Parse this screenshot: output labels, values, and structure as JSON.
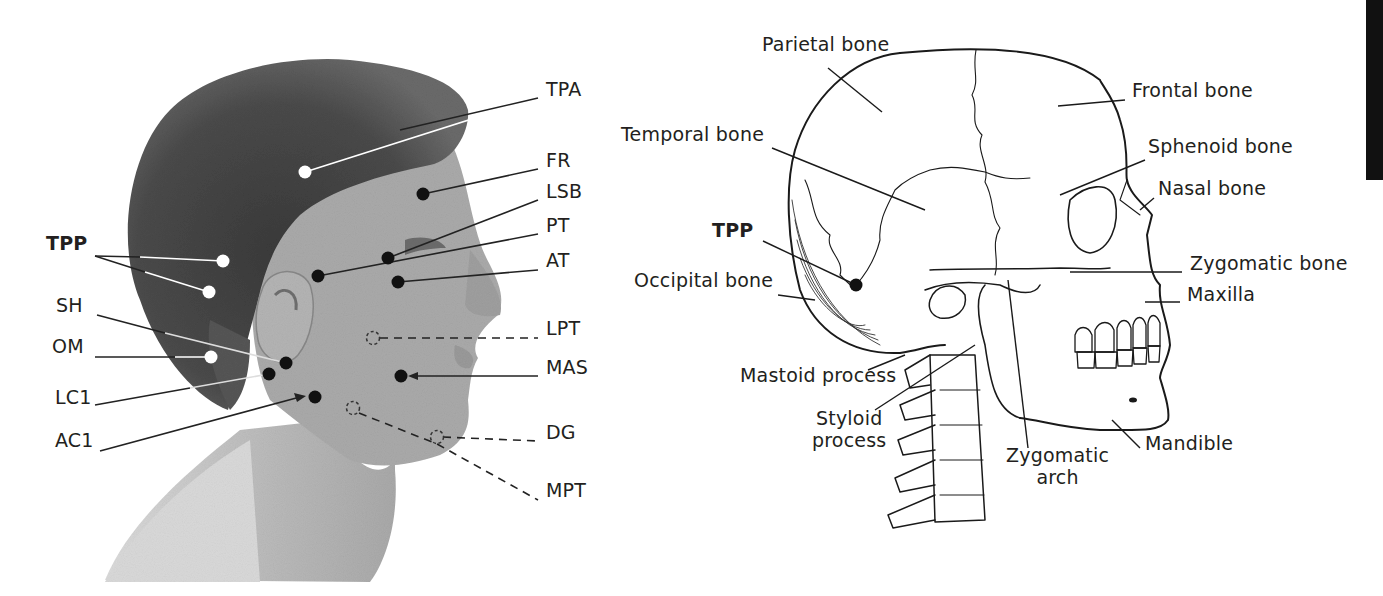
{
  "figure": {
    "left_panel": {
      "title": "Photograph of head in profile with trigger/injection points",
      "labels": [
        {
          "id": "TPA",
          "text": "TPA",
          "x": 546,
          "y": 89,
          "bold": false
        },
        {
          "id": "FR",
          "text": "FR",
          "x": 546,
          "y": 160,
          "bold": false
        },
        {
          "id": "LSB",
          "text": "LSB",
          "x": 546,
          "y": 191,
          "bold": false
        },
        {
          "id": "PT",
          "text": "PT",
          "x": 546,
          "y": 225,
          "bold": false
        },
        {
          "id": "AT",
          "text": "AT",
          "x": 546,
          "y": 260,
          "bold": false
        },
        {
          "id": "LPT",
          "text": "LPT",
          "x": 546,
          "y": 328,
          "bold": false
        },
        {
          "id": "MAS",
          "text": "MAS",
          "x": 546,
          "y": 367,
          "bold": false
        },
        {
          "id": "DG",
          "text": "DG",
          "x": 546,
          "y": 432,
          "bold": false
        },
        {
          "id": "MPT",
          "text": "MPT",
          "x": 546,
          "y": 490,
          "bold": false
        },
        {
          "id": "TPP",
          "text": "TPP",
          "x": 46,
          "y": 243,
          "bold": true
        },
        {
          "id": "SH",
          "text": "SH",
          "x": 56,
          "y": 305,
          "bold": false
        },
        {
          "id": "OM",
          "text": "OM",
          "x": 52,
          "y": 346,
          "bold": false
        },
        {
          "id": "LC1",
          "text": "LC1",
          "x": 55,
          "y": 397,
          "bold": false
        },
        {
          "id": "AC1",
          "text": "AC1",
          "x": 55,
          "y": 440,
          "bold": false
        }
      ],
      "points": [
        {
          "id": "TPA",
          "x": 305,
          "y": 172,
          "fill": "white",
          "style": "solid"
        },
        {
          "id": "FR",
          "x": 423,
          "y": 194,
          "fill": "black",
          "style": "solid"
        },
        {
          "id": "LSB",
          "x": 388,
          "y": 258,
          "fill": "black",
          "style": "solid"
        },
        {
          "id": "PT",
          "x": 318,
          "y": 276,
          "fill": "black",
          "style": "solid"
        },
        {
          "id": "AT",
          "x": 398,
          "y": 282,
          "fill": "black",
          "style": "solid"
        },
        {
          "id": "LPT",
          "x": 373,
          "y": 338,
          "fill": "none",
          "style": "dashed"
        },
        {
          "id": "MAS",
          "x": 401,
          "y": 376,
          "fill": "black",
          "style": "solid"
        },
        {
          "id": "DG",
          "x": 437,
          "y": 437,
          "fill": "none",
          "style": "dashed"
        },
        {
          "id": "MPT",
          "x": 353,
          "y": 408,
          "fill": "none",
          "style": "dashed"
        },
        {
          "id": "TPP1",
          "x": 223,
          "y": 261,
          "fill": "white",
          "style": "solid"
        },
        {
          "id": "TPP2",
          "x": 209,
          "y": 292,
          "fill": "white",
          "style": "solid"
        },
        {
          "id": "SH",
          "x": 286,
          "y": 363,
          "fill": "black",
          "style": "solid"
        },
        {
          "id": "OM",
          "x": 211,
          "y": 357,
          "fill": "white",
          "style": "solid"
        },
        {
          "id": "LC1",
          "x": 269,
          "y": 374,
          "fill": "black",
          "style": "solid"
        },
        {
          "id": "AC1",
          "x": 315,
          "y": 397,
          "fill": "black",
          "style": "solid"
        }
      ]
    },
    "right_panel": {
      "title": "Lateral view of skull and cervical spine",
      "labels": [
        {
          "id": "parietal",
          "text": "Parietal bone",
          "x": 762,
          "y": 44,
          "bold": false
        },
        {
          "id": "frontal",
          "text": "Frontal bone",
          "x": 1132,
          "y": 90,
          "bold": false
        },
        {
          "id": "temporal",
          "text": "Temporal bone",
          "x": 621,
          "y": 134,
          "bold": false
        },
        {
          "id": "sphenoid",
          "text": "Sphenoid bone",
          "x": 1148,
          "y": 146,
          "bold": false
        },
        {
          "id": "nasal",
          "text": "Nasal bone",
          "x": 1158,
          "y": 188,
          "bold": false
        },
        {
          "id": "tpp",
          "text": "TPP",
          "x": 712,
          "y": 230,
          "bold": true
        },
        {
          "id": "zygomatic_bone",
          "text": "Zygomatic bone",
          "x": 1190,
          "y": 263,
          "bold": false
        },
        {
          "id": "occipital",
          "text": "Occipital bone",
          "x": 634,
          "y": 280,
          "bold": false
        },
        {
          "id": "maxilla",
          "text": "Maxilla",
          "x": 1187,
          "y": 294,
          "bold": false
        },
        {
          "id": "mastoid",
          "text": "Mastoid process",
          "x": 740,
          "y": 375,
          "bold": false
        },
        {
          "id": "styloid",
          "text": "Styloid\nprocess",
          "x": 812,
          "y": 418,
          "bold": false
        },
        {
          "id": "zygomatic_arch",
          "text": "Zygomatic\narch",
          "x": 1006,
          "y": 455,
          "bold": false
        },
        {
          "id": "mandible",
          "text": "Mandible",
          "x": 1145,
          "y": 443,
          "bold": false
        }
      ],
      "marker": {
        "id": "TPP",
        "x": 856,
        "y": 285
      }
    },
    "side_tab_color": "#111111"
  }
}
